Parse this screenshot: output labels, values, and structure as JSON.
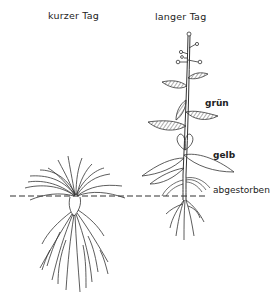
{
  "diagram": {
    "titles": {
      "short_day": "kurzer Tag",
      "long_day": "langer Tag"
    },
    "labels": {
      "green": "grün",
      "yellow": "gelb",
      "dead": "abgestorben"
    },
    "plants": [
      {
        "name": "short-day-plant",
        "form": "rosette",
        "description": "leaf rosette at soil level with large root system"
      },
      {
        "name": "long-day-plant",
        "form": "bolting stem",
        "description": "elongated flowering stem with leaves; upper leaves green, middle leaves yellow, lowest leaves dead"
      }
    ],
    "ground_line": "dashed",
    "colors": {
      "ink": "#222222",
      "background": "#ffffff"
    }
  }
}
